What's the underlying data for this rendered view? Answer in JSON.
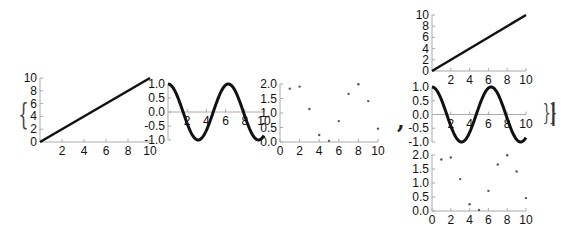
{
  "glyphs": {
    "open_brace": "{",
    "comma": ",",
    "close_braces": "}}",
    "cursor": "|"
  },
  "colors": {
    "line": "#111111",
    "axis": "#aaaaaa",
    "point": "#555555",
    "text": "#111111"
  },
  "chart_data": [
    {
      "id": "left-line",
      "type": "line",
      "title": "",
      "xlabel": "",
      "ylabel": "",
      "x": [
        0,
        10
      ],
      "values": [
        0,
        10
      ],
      "xlim": [
        0,
        10
      ],
      "ylim": [
        0,
        10
      ],
      "xticks": [
        "2",
        "4",
        "6",
        "8",
        "10"
      ],
      "yticks": [
        "0",
        "2",
        "4",
        "6",
        "8",
        "10"
      ],
      "grid": false,
      "legend": null,
      "box": {
        "left": 40,
        "top": 78,
        "width": 110,
        "height": 64
      }
    },
    {
      "id": "left-cos",
      "type": "line",
      "title": "",
      "xlabel": "",
      "ylabel": "",
      "function": "cos(x)",
      "xlim": [
        0,
        10
      ],
      "ylim": [
        -1,
        1
      ],
      "xticks": [
        "2",
        "4",
        "6",
        "8",
        "10"
      ],
      "yticks": [
        "1.0",
        "0.5",
        "0.0",
        "-0.5",
        "-1.0"
      ],
      "grid": false,
      "legend": null,
      "box": {
        "left": 168,
        "top": 84,
        "width": 96,
        "height": 56
      }
    },
    {
      "id": "left-scatter",
      "type": "scatter",
      "title": "",
      "xlabel": "",
      "ylabel": "",
      "x": [
        1,
        2,
        3,
        4,
        5,
        6,
        7,
        8,
        9,
        10
      ],
      "values": [
        1.84,
        1.91,
        1.14,
        0.24,
        0.04,
        0.72,
        1.66,
        1.99,
        1.41,
        0.46
      ],
      "function": "1+sin(x)",
      "xlim": [
        0,
        10
      ],
      "ylim": [
        0,
        2
      ],
      "xticks": [
        "0",
        "2",
        "4",
        "6",
        "8",
        "10"
      ],
      "yticks": [
        "2.0",
        "1.5",
        "1.0",
        "0.5",
        "0.0"
      ],
      "grid": false,
      "legend": null,
      "box": {
        "left": 280,
        "top": 84,
        "width": 98,
        "height": 58
      }
    },
    {
      "id": "right-line",
      "type": "line",
      "title": "",
      "xlabel": "",
      "ylabel": "",
      "x": [
        0,
        10
      ],
      "values": [
        0,
        10
      ],
      "xlim": [
        0,
        10
      ],
      "ylim": [
        0,
        10
      ],
      "xticks": [
        "2",
        "4",
        "6",
        "8",
        "10"
      ],
      "yticks": [
        "0",
        "2",
        "4",
        "6",
        "8",
        "10"
      ],
      "grid": false,
      "legend": null,
      "box": {
        "left": 432,
        "top": 15,
        "width": 94,
        "height": 56
      }
    },
    {
      "id": "right-cos",
      "type": "line",
      "title": "",
      "xlabel": "",
      "ylabel": "",
      "function": "cos(x)",
      "xlim": [
        0,
        10
      ],
      "ylim": [
        -1,
        1
      ],
      "xticks": [
        "2",
        "4",
        "6",
        "8",
        "10"
      ],
      "yticks": [
        "1.0",
        "0.5",
        "0.0",
        "-0.5",
        "-1.0"
      ],
      "grid": false,
      "legend": null,
      "box": {
        "left": 432,
        "top": 87,
        "width": 94,
        "height": 55
      }
    },
    {
      "id": "right-scatter",
      "type": "scatter",
      "title": "",
      "xlabel": "",
      "ylabel": "",
      "x": [
        1,
        2,
        3,
        4,
        5,
        6,
        7,
        8,
        9,
        10
      ],
      "values": [
        1.84,
        1.91,
        1.14,
        0.24,
        0.04,
        0.72,
        1.66,
        1.99,
        1.41,
        0.46
      ],
      "function": "1+sin(x)",
      "xlim": [
        0,
        10
      ],
      "ylim": [
        0,
        2
      ],
      "xticks": [
        "0",
        "2",
        "4",
        "6",
        "8",
        "10"
      ],
      "yticks": [
        "2.0",
        "1.5",
        "1.0",
        "0.5",
        "0.0"
      ],
      "grid": false,
      "legend": null,
      "box": {
        "left": 432,
        "top": 155,
        "width": 94,
        "height": 56
      }
    }
  ]
}
